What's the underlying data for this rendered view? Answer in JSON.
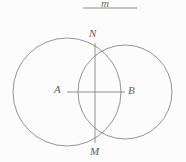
{
  "figure": {
    "kind": "geometry-diagram",
    "background_color": "#fcfcfc",
    "stroke_color": "#7a7a7a",
    "label_color": "#5c5c5c",
    "stroke_width": 0.8,
    "canvas": {
      "width": 186,
      "height": 162
    },
    "top_line": {
      "label": "m",
      "x1": 83,
      "y1": 8,
      "x2": 137,
      "y2": 8
    },
    "circles": [
      {
        "name": "circle-A",
        "center_label": "A",
        "cx": 67,
        "cy": 92,
        "r": 54
      },
      {
        "name": "circle-B",
        "center_label": "B",
        "cx": 125,
        "cy": 92,
        "r": 47
      }
    ],
    "points": [
      {
        "label": "N",
        "x": 95,
        "y": 43
      },
      {
        "label": "A",
        "x": 67,
        "y": 92
      },
      {
        "label": "B",
        "x": 125,
        "y": 92
      },
      {
        "label": "M",
        "x": 95,
        "y": 143
      }
    ],
    "segments": [
      {
        "name": "segment-AB",
        "from": "A",
        "to": "B",
        "x1": 67,
        "y1": 92,
        "x2": 125,
        "y2": 92
      },
      {
        "name": "segment-MN",
        "from": "N",
        "to": "M",
        "x1": 95,
        "y1": 43,
        "x2": 95,
        "y2": 143
      }
    ]
  }
}
